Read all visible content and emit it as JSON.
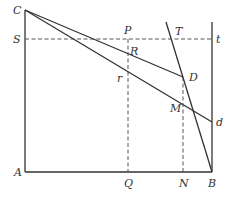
{
  "diagram": {
    "title": "",
    "colors": {
      "line": "#333333",
      "background": "#ffffff"
    },
    "points": {
      "C": {
        "label": "C",
        "x": 25,
        "y": 10
      },
      "A": {
        "label": "A",
        "x": 25,
        "y": 172
      },
      "B": {
        "label": "B",
        "x": 212,
        "y": 172
      },
      "S": {
        "label": "S",
        "x": 25,
        "y": 39
      },
      "t": {
        "label": "t",
        "x": 212,
        "y": 39
      },
      "P": {
        "label": "P",
        "x": 128,
        "y": 39
      },
      "T": {
        "label": "T",
        "x": 171,
        "y": 39
      },
      "R": {
        "label": "R",
        "x": 128,
        "y": 50
      },
      "D": {
        "label": "D",
        "x": 183,
        "y": 77
      },
      "r": {
        "label": "r",
        "x": 128,
        "y": 72
      },
      "M": {
        "label": "M",
        "x": 183,
        "y": 105
      },
      "d": {
        "label": "d",
        "x": 212,
        "y": 122
      },
      "Q": {
        "label": "Q",
        "x": 128,
        "y": 172
      },
      "N": {
        "label": "N",
        "x": 183,
        "y": 172
      }
    },
    "labels": {
      "C": "C",
      "S": "S",
      "A": "A",
      "P": "P",
      "T": "T",
      "t": "t",
      "R": "R",
      "D": "D",
      "r": "r",
      "M": "M",
      "d": "d",
      "Q": "Q",
      "N": "N",
      "B": "B"
    },
    "segments_solid": [
      "CA",
      "AB",
      "B-top(212,22)",
      "CD",
      "Cd",
      "T-line(166,22)-B"
    ],
    "segments_dashed": [
      "St",
      "PQ",
      "DN"
    ]
  }
}
